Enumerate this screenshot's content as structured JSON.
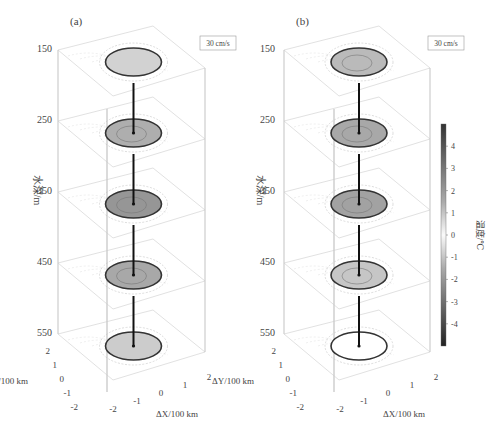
{
  "chart_data": {
    "type": "3d-stacked-contour",
    "panels": [
      {
        "id": "a",
        "label": "(a)",
        "scale_label": "30 cm/s",
        "depth_ticks": [
          150,
          250,
          350,
          450,
          550
        ],
        "ylabel": "水深/m",
        "x_ticks": [
          "-2",
          "-1",
          "0",
          "1",
          "2"
        ],
        "y_ticks": [
          "2",
          "1",
          "0",
          "-1",
          "-2"
        ],
        "xlabel": "ΔX/100 km",
        "ylabel_h": "ΔY/100 km",
        "layers": [
          {
            "depth": 150,
            "core_intensity": 0.25
          },
          {
            "depth": 250,
            "core_intensity": 0.55
          },
          {
            "depth": 350,
            "core_intensity": 0.75
          },
          {
            "depth": 450,
            "core_intensity": 0.6
          },
          {
            "depth": 550,
            "core_intensity": 0.3
          }
        ]
      },
      {
        "id": "b",
        "label": "(b)",
        "scale_label": "30 cm/s",
        "depth_ticks": [
          150,
          250,
          350,
          450,
          550
        ],
        "ylabel": "水深/m",
        "x_ticks": [
          "-2",
          "-1",
          "0",
          "1",
          "2"
        ],
        "y_ticks": [
          "2",
          "1",
          "0",
          "-1",
          "-2"
        ],
        "xlabel": "ΔX/100 km",
        "ylabel_h": "ΔY/100 km",
        "layers": [
          {
            "depth": 150,
            "core_intensity": 0.45
          },
          {
            "depth": 250,
            "core_intensity": 0.6
          },
          {
            "depth": 350,
            "core_intensity": 0.65
          },
          {
            "depth": 450,
            "core_intensity": 0.35
          },
          {
            "depth": 550,
            "core_intensity": 0.0
          }
        ]
      }
    ],
    "colorbar": {
      "label": "温度/℃",
      "ticks": [
        "4",
        "3",
        "2",
        "1",
        "0",
        "-1",
        "-2",
        "-3",
        "-4"
      ],
      "range": [
        -5,
        5
      ]
    }
  }
}
